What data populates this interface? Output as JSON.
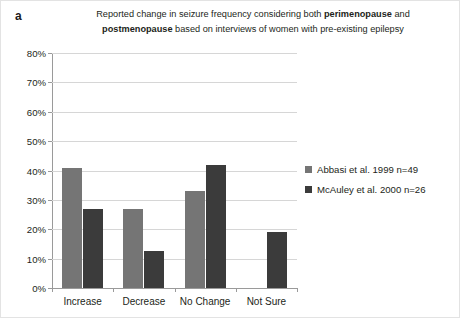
{
  "panel": {
    "letter": "a"
  },
  "title": {
    "line1_pre": "Reported change in seizure frequency considering both ",
    "line1_bold": "perimenopause",
    "line1_post": " and",
    "line2_bold": "postmenopause",
    "line2_post": " based on interviews of women with pre-existing epilepsy"
  },
  "chart_data": {
    "type": "bar",
    "title": "Reported change in seizure frequency considering both perimenopause and postmenopause based on interviews of women with pre-existing epilepsy",
    "xlabel": "",
    "ylabel": "",
    "ylim": [
      0,
      80
    ],
    "ytick_labels": [
      "80%",
      "70%",
      "60%",
      "50%",
      "40%",
      "30%",
      "20%",
      "10%",
      "0%"
    ],
    "ytick_values": [
      80,
      70,
      60,
      50,
      40,
      30,
      20,
      10,
      0
    ],
    "grid": true,
    "legend_position": "right",
    "categories": [
      "Increase",
      "Decrease",
      "No Change",
      "Not  Sure"
    ],
    "series": [
      {
        "name": "Abbasi et al. 1999 n=49",
        "color": "#757575",
        "values": [
          41,
          27,
          33,
          0
        ]
      },
      {
        "name": "McAuley et al. 2000 n=26",
        "color": "#3b3b3b",
        "values": [
          27,
          12.5,
          42,
          19
        ]
      }
    ]
  }
}
